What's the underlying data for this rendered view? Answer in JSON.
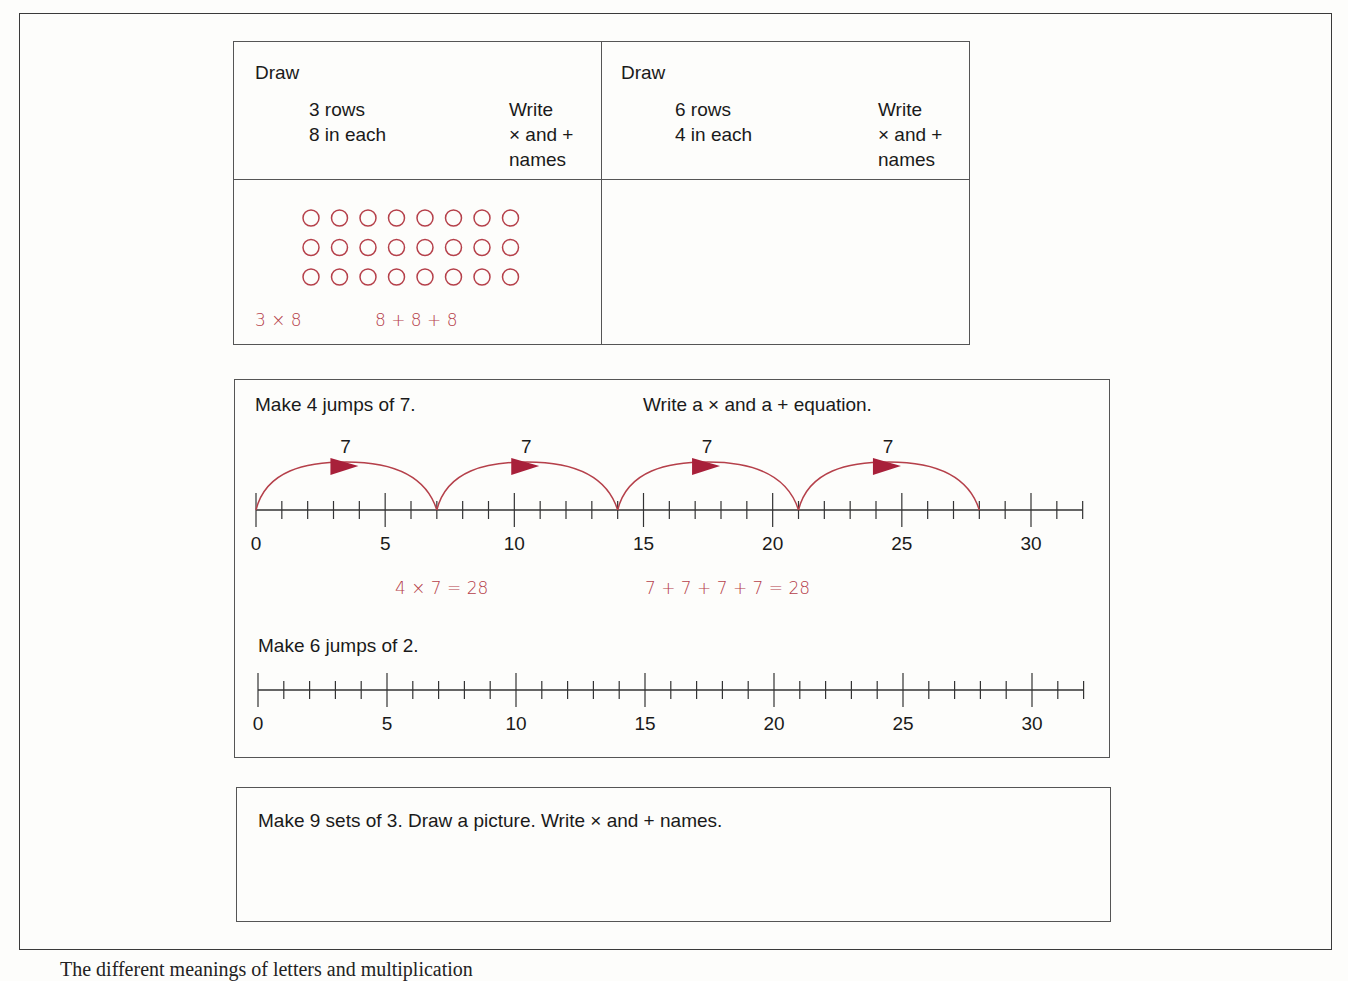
{
  "page": {
    "caption_partial": "The different meanings of letters and multiplication"
  },
  "array_task": {
    "left": {
      "title": "Draw",
      "spec_line1": "3 rows",
      "spec_line2": "8 in each",
      "write_line1": "Write",
      "write_line2": "× and +",
      "write_line3": "names",
      "rows": 3,
      "per_row": 8,
      "answer_times": "3 × 8",
      "answer_plus": "8 + 8 + 8"
    },
    "right": {
      "title": "Draw",
      "spec_line1": "6 rows",
      "spec_line2": "4 in each",
      "write_line1": "Write",
      "write_line2": "× and +",
      "write_line3": "names"
    }
  },
  "jumps_task": {
    "prompt1": "Make 4 jumps of 7.",
    "prompt1_instruction": "Write a × and a + equation.",
    "jump_size": 7,
    "jump_count": 4,
    "jump_label": "7",
    "answer_times": "4 × 7 = 28",
    "answer_plus": "7 + 7 + 7 + 7 = 28",
    "prompt2": "Make 6 jumps of 2.",
    "axis_labels": [
      "0",
      "5",
      "10",
      "15",
      "20",
      "25",
      "30"
    ],
    "axis_max": 32
  },
  "sets_task": {
    "prompt": "Make 9 sets of 3.  Draw a picture.  Write × and + names."
  },
  "colors": {
    "ink": "#1a1a1a",
    "answer_red": "#b5404a",
    "arrow_fill": "#a8203a",
    "border": "#555555"
  }
}
